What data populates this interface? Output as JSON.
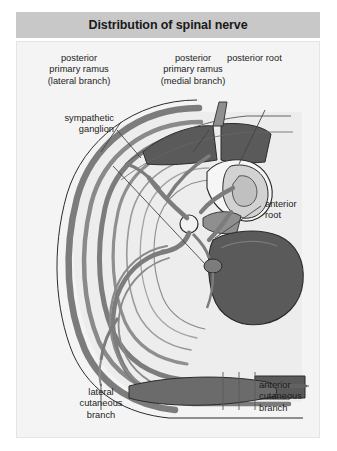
{
  "figure": {
    "title": "Distribution of spinal nerve",
    "kind": "anatomical-diagram"
  },
  "colors": {
    "title_bar_bg": "#c8c8c8",
    "title_text": "#1a1a1a",
    "panel_bg": "#f4f4f4",
    "panel_border": "#e4e4e4",
    "page_bg": "#ffffff",
    "nerve_gray": "#7c7c7c",
    "muscle_dark": "#5a5a5a",
    "bone_mid": "#8f8f8f",
    "cavity_fill": "#ededed",
    "cord_fill": "#d2d2d2",
    "outline": "#2b2b2b",
    "leader_line": "#444444",
    "label_text": "#1d1d1d"
  },
  "labels": [
    {
      "id": "posterior-primary-ramus-lateral",
      "lines": [
        "posterior",
        "primary ramus",
        "(lateral branch)"
      ],
      "align": "center",
      "x": 62,
      "y": 52
    },
    {
      "id": "posterior-primary-ramus-medial",
      "lines": [
        "posterior",
        "primary ramus",
        "(medial branch)"
      ],
      "align": "center",
      "x": 158,
      "y": 52
    },
    {
      "id": "posterior-root",
      "lines": [
        "posterior root"
      ],
      "align": "left",
      "x": 226,
      "y": 52
    },
    {
      "id": "sympathetic-ganglion",
      "lines": [
        "sympathetic",
        "ganglion"
      ],
      "align": "right",
      "x": 16,
      "y": 112
    },
    {
      "id": "anterior-root",
      "lines": [
        "anterior",
        "root"
      ],
      "align": "left",
      "x": 264,
      "y": 198
    },
    {
      "id": "lateral-cutaneous-branch",
      "lines": [
        "lateral",
        "cutaneous",
        "branch"
      ],
      "align": "center",
      "x": 60,
      "y": 388
    },
    {
      "id": "anterior-cutaneous-branch",
      "lines": [
        "anterior",
        "cutaneous",
        "branch"
      ],
      "align": "left",
      "x": 258,
      "y": 381
    }
  ]
}
